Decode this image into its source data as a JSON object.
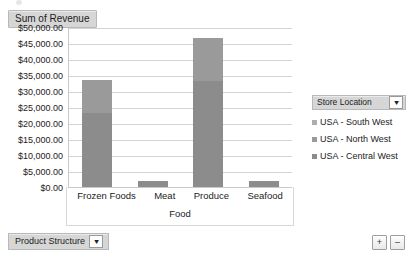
{
  "value_field_button": {
    "label": "Sum of Revenue",
    "name": "sum-of-revenue"
  },
  "legend_panel": {
    "field_label": "Store Location",
    "filter_icon": "filter-icon",
    "entries": [
      {
        "label": "USA - South West",
        "color": "#adadad"
      },
      {
        "label": "USA - North West",
        "color": "#9a9a9a"
      },
      {
        "label": "USA - Central West",
        "color": "#8c8c8c"
      }
    ]
  },
  "bottom_bar": {
    "field_label": "Product Structure",
    "filter_icon": "filter-icon",
    "zoom_in_label": "+",
    "zoom_out_label": "–"
  },
  "chart_data": {
    "type": "bar",
    "stacked": true,
    "title": "Sum of Revenue",
    "xlabel": "Food",
    "ylabel": "",
    "ylim": [
      0,
      50000
    ],
    "grid": true,
    "legend_position": "right",
    "legend_title": "Store Location",
    "categories": [
      "Frozen Foods",
      "Meat",
      "Produce",
      "Seafood"
    ],
    "ytick_labels": [
      "$50,000.00",
      "$45,000.00",
      "$40,000.00",
      "$35,000.00",
      "$30,000.00",
      "$25,000.00",
      "$20,000.00",
      "$15,000.00",
      "$10,000.00",
      "$5,000.00",
      "$0.00"
    ],
    "ytick_values": [
      50000,
      45000,
      40000,
      35000,
      30000,
      25000,
      20000,
      15000,
      10000,
      5000,
      0
    ],
    "series": [
      {
        "name": "USA - Central West",
        "color": "#8c8c8c",
        "values": [
          23000,
          1800,
          33000,
          1800
        ]
      },
      {
        "name": "USA - North West",
        "color": "#9a9a9a",
        "values": [
          10500,
          0,
          13500,
          0
        ]
      },
      {
        "name": "USA - South West",
        "color": "#adadad",
        "values": [
          0,
          0,
          0,
          0
        ]
      }
    ],
    "totals": [
      33500,
      1800,
      46500,
      1800
    ]
  }
}
